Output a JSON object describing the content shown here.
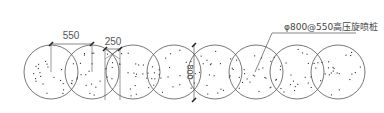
{
  "diagram": {
    "callout": {
      "label": "φ800@550高压旋喷桩",
      "leader_from": [
        290,
        33
      ],
      "leader_elbow": [
        272,
        33
      ],
      "leader_to": [
        255,
        72
      ],
      "underline_to": 356
    },
    "dimensions": [
      {
        "label": "550",
        "orientation": "horizontal",
        "x1": 51,
        "x2": 92,
        "y": 44,
        "text_x": 71,
        "text_y": 39
      },
      {
        "label": "250",
        "orientation": "horizontal",
        "x1": 105,
        "x2": 120,
        "y": 49,
        "text_x": 113,
        "text_y": 45
      },
      {
        "label": "800",
        "orientation": "vertical",
        "x": 194,
        "y1": 45,
        "y2": 100,
        "text_x": 187,
        "text_y": 72
      }
    ],
    "piles": {
      "count": 8,
      "radius": 27,
      "center_y": 72,
      "centers_x": [
        51,
        92,
        133,
        174,
        215,
        256,
        297,
        338
      ],
      "stroke_color": "#555555"
    }
  }
}
